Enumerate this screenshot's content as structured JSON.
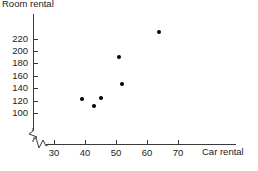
{
  "chart_data": {
    "type": "scatter",
    "title": "Room rental",
    "xlabel": "Car rental",
    "ylabel": "Room rental",
    "xticks": [
      30,
      40,
      50,
      60,
      70
    ],
    "yticks": [
      100,
      120,
      140,
      160,
      180,
      200,
      220
    ],
    "xlim": [
      25,
      75
    ],
    "ylim": [
      95,
      230
    ],
    "grid": false,
    "legend": "none",
    "axis_break_x": true,
    "axis_break_y": true,
    "marker_color": "#000000",
    "axis_color": "#3a3a3a",
    "points": [
      {
        "x": 39,
        "y": 122
      },
      {
        "x": 43,
        "y": 112
      },
      {
        "x": 45,
        "y": 125
      },
      {
        "x": 51,
        "y": 190
      },
      {
        "x": 52,
        "y": 147
      },
      {
        "x": 64,
        "y": 230
      }
    ]
  }
}
